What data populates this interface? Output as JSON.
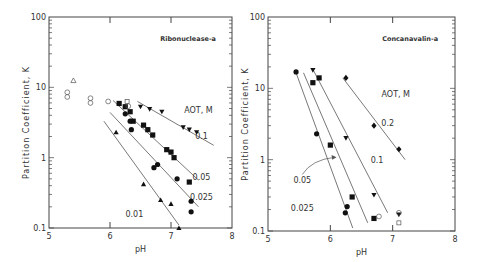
{
  "chart_data": [
    {
      "type": "scatter",
      "title": "Ribonuclease-a",
      "xlabel": "pH",
      "ylabel": "Partition Coefficient, K",
      "xlim": [
        5,
        8
      ],
      "ylim": [
        0.1,
        100
      ],
      "yscale": "log",
      "xticks": [
        5,
        6,
        7,
        8
      ],
      "yticks": [
        0.1,
        1,
        10,
        100
      ],
      "ytick_labels": [
        "0.1",
        "1",
        "10",
        "100"
      ],
      "legend_title": "AOT, M",
      "frame": {
        "x0": 49,
        "x1": 232,
        "y_top": 17,
        "y_bottom": 228
      },
      "series": [
        {
          "name": "0.1",
          "marker": "triangle-down-filled",
          "points": [
            [
              6.5,
              5.3
            ],
            [
              6.65,
              4.9
            ],
            [
              6.85,
              4.5
            ],
            [
              7.2,
              2.7
            ],
            [
              7.3,
              2.5
            ],
            [
              7.42,
              2.3
            ]
          ],
          "fit": [
            [
              6.45,
              6.3
            ],
            [
              7.7,
              1.5
            ]
          ],
          "label_pos": [
            7.5,
            2.0
          ]
        },
        {
          "name": "0.05",
          "marker": "square-filled",
          "points": [
            [
              6.15,
              5.9
            ],
            [
              6.25,
              5.3
            ],
            [
              6.33,
              4.5
            ],
            [
              6.38,
              3.3
            ],
            [
              6.55,
              2.9
            ],
            [
              6.62,
              2.5
            ],
            [
              6.7,
              2.1
            ],
            [
              6.93,
              1.3
            ],
            [
              7.0,
              1.2
            ],
            [
              7.05,
              1.0
            ],
            [
              7.3,
              0.45
            ]
          ],
          "fit": [
            [
              6.05,
              6.5
            ],
            [
              7.45,
              0.48
            ]
          ],
          "label_pos": [
            7.5,
            0.53
          ]
        },
        {
          "name": "0.025",
          "marker": "circle-filled",
          "points": [
            [
              6.25,
              4.2
            ],
            [
              6.33,
              3.3
            ],
            [
              6.35,
              2.5
            ],
            [
              6.72,
              0.72
            ],
            [
              6.78,
              0.8
            ],
            [
              7.1,
              0.5
            ],
            [
              7.33,
              0.24
            ],
            [
              7.33,
              0.17
            ]
          ],
          "fit": [
            [
              6.0,
              4.4
            ],
            [
              7.45,
              0.2
            ]
          ],
          "label_pos": [
            7.5,
            0.28
          ]
        },
        {
          "name": "0.01",
          "marker": "triangle-up-filled",
          "points": [
            [
              6.1,
              2.3
            ],
            [
              6.55,
              0.42
            ],
            [
              6.83,
              0.25
            ],
            [
              7.0,
              0.22
            ],
            [
              7.13,
              0.1
            ]
          ],
          "fit": [
            [
              5.9,
              3.3
            ],
            [
              7.13,
              0.11
            ]
          ],
          "label_pos": [
            6.4,
            0.16
          ]
        },
        {
          "name": "open",
          "marker": "open-mixed",
          "points": [
            [
              5.4,
              12.5
            ],
            [
              5.3,
              8.5
            ],
            [
              5.3,
              7.3
            ],
            [
              5.68,
              7.0
            ],
            [
              5.68,
              6.0
            ],
            [
              5.97,
              6.3
            ],
            [
              6.28,
              6.3
            ],
            [
              6.3,
              5.4
            ]
          ]
        }
      ]
    },
    {
      "type": "scatter",
      "title": "Concanavalin-a",
      "xlabel": "pH",
      "ylabel": "Partition Coefficient, K",
      "xlim": [
        5,
        8
      ],
      "ylim": [
        0.1,
        100
      ],
      "yscale": "log",
      "xticks": [
        5,
        6,
        7,
        8
      ],
      "yticks": [
        0.1,
        1,
        10,
        100
      ],
      "ytick_labels": [
        "0.1",
        "1",
        "10",
        "100"
      ],
      "legend_title": "AOT, M",
      "frame": {
        "x0": 268,
        "x1": 455,
        "y_top": 17,
        "y_bottom": 231
      },
      "series": [
        {
          "name": "0.2",
          "marker": "diamond-filled",
          "points": [
            [
              6.25,
              14.0
            ],
            [
              6.7,
              3.0
            ],
            [
              7.1,
              1.4
            ]
          ],
          "fit": [
            [
              6.2,
              14.0
            ],
            [
              7.2,
              1.0
            ]
          ],
          "label_pos": [
            6.92,
            3.3
          ]
        },
        {
          "name": "0.1",
          "marker": "triangle-down-filled",
          "points": [
            [
              5.72,
              18.0
            ],
            [
              6.25,
              2.0
            ],
            [
              6.7,
              0.32
            ],
            [
              7.1,
              0.17
            ]
          ],
          "fit": [
            [
              5.72,
              18.5
            ],
            [
              6.92,
              0.18
            ]
          ],
          "label_pos": [
            6.75,
            1.0
          ]
        },
        {
          "name": "0.05",
          "marker": "square-filled",
          "points": [
            [
              5.72,
              12.0
            ],
            [
              5.82,
              14.0
            ],
            [
              6.0,
              1.6
            ],
            [
              6.35,
              0.3
            ],
            [
              6.7,
              0.15
            ]
          ],
          "fit": [
            [
              5.57,
              16.5
            ],
            [
              6.6,
              0.13
            ]
          ],
          "label_pos": [
            5.55,
            0.52
          ]
        },
        {
          "name": "0.025",
          "marker": "circle-filled",
          "points": [
            [
              5.45,
              17.0
            ],
            [
              5.78,
              2.3
            ],
            [
              6.27,
              0.22
            ],
            [
              6.24,
              0.18
            ]
          ],
          "fit": [
            [
              5.45,
              16.5
            ],
            [
              6.36,
              0.11
            ]
          ],
          "label_pos": [
            5.55,
            0.21
          ]
        },
        {
          "name": "open",
          "marker": "open-mixed",
          "points": [
            [
              6.78,
              0.16
            ],
            [
              7.1,
              0.18
            ],
            [
              7.1,
              0.13
            ]
          ]
        }
      ]
    }
  ],
  "labels": {
    "left_title": "Ribonuclease-a",
    "right_title": "Concanavalin-a",
    "legend_title": "AOT, M",
    "xlabel": "pH",
    "ylabel": "Partition Coefficient, K"
  }
}
